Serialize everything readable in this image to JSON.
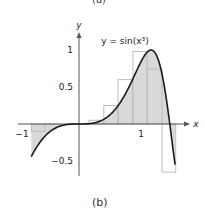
{
  "top_caption": "(a)",
  "caption": "(b)",
  "chart_data": {
    "type": "line",
    "title": "",
    "function_label": "y = sin(x³)",
    "xlabel": "x",
    "ylabel": "y",
    "x_ticks": [
      {
        "value": -1,
        "label": "−1"
      },
      {
        "value": 1,
        "label": "1"
      }
    ],
    "y_ticks": [
      {
        "value": 1,
        "label": "1"
      },
      {
        "value": 0.5,
        "label": "0.5"
      },
      {
        "value": -0.5,
        "label": "−0.5"
      }
    ],
    "xlim": [
      -1,
      1.6
    ],
    "ylim": [
      -0.65,
      1.2
    ],
    "grid": false,
    "domain": [
      -0.77,
      1.55
    ],
    "rectangles": [
      {
        "x0": -0.77,
        "x1": -0.55,
        "height": -0.1
      },
      {
        "x0": -0.55,
        "x1": -0.32,
        "height": 0
      },
      {
        "x0": 0.16,
        "x1": 0.4,
        "height": 0.05
      },
      {
        "x0": 0.4,
        "x1": 0.63,
        "height": 0.25
      },
      {
        "x0": 0.63,
        "x1": 0.87,
        "height": 0.6
      },
      {
        "x0": 0.87,
        "x1": 1.1,
        "height": 0.98
      },
      {
        "x0": 1.1,
        "x1": 1.34,
        "height": 0.74
      },
      {
        "x0": 1.34,
        "x1": 1.56,
        "height": -0.65
      }
    ],
    "colors": {
      "curve": "#1a1a1a",
      "fill": "#d9d9d9",
      "rect_stroke": "#bdbdbd",
      "axis": "#555555"
    }
  }
}
